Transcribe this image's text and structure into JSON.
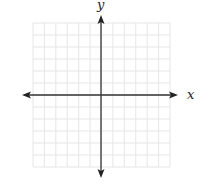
{
  "diagram": {
    "type": "coordinate-plane",
    "x_axis_label": "x",
    "y_axis_label": "y",
    "grid": {
      "columns": 12,
      "rows": 12,
      "left": 33,
      "top": 23,
      "right": 170,
      "bottom": 167,
      "line_color": "#e6e6e6"
    },
    "origin": {
      "x": 101,
      "y": 95
    },
    "x_axis": {
      "from": 22,
      "to": 178
    },
    "y_axis": {
      "from": 15,
      "to": 178
    },
    "axis_color": "#333333"
  }
}
